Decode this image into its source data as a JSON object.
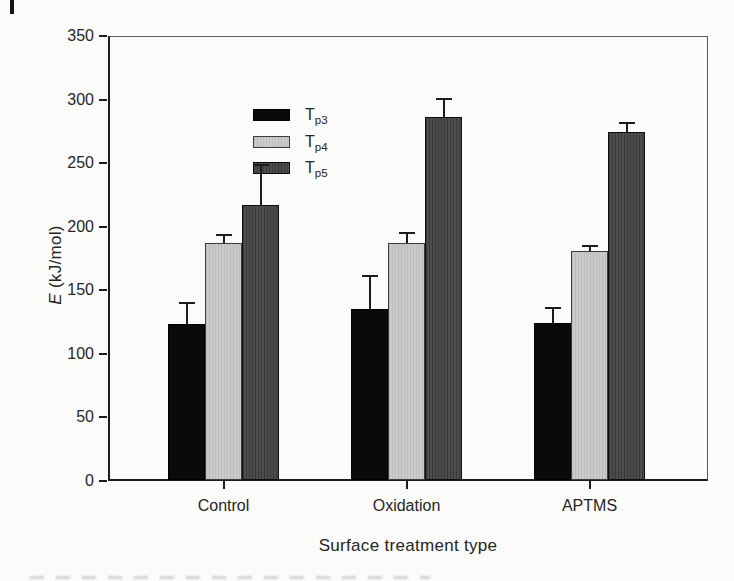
{
  "figure": {
    "kind": "scanned-book-bar-chart"
  },
  "chart_data": {
    "type": "bar",
    "title": "",
    "xlabel": "Surface treatment type",
    "ylabel_var": "E",
    "ylabel_unit": " (kJ/mol)",
    "ylim": [
      0,
      350
    ],
    "yticks": [
      0,
      50,
      100,
      150,
      200,
      250,
      300,
      350
    ],
    "grid": false,
    "legend_position": "upper-left",
    "categories": [
      "Control",
      "Oxidation",
      "APTMS"
    ],
    "series": [
      {
        "name_main": "T",
        "name_sub": "p3",
        "color": "#0a0a0a",
        "pattern": "solid",
        "values": [
          124,
          136,
          125
        ],
        "errors_plus": [
          17,
          26,
          12
        ]
      },
      {
        "name_main": "T",
        "name_sub": "p4",
        "color": "#c5c5c5",
        "pattern": "fine-vertical-light",
        "values": [
          188,
          188,
          182
        ],
        "errors_plus": [
          6,
          8,
          4
        ]
      },
      {
        "name_main": "T",
        "name_sub": "p5",
        "color": "#474747",
        "pattern": "fine-vertical-dark",
        "values": [
          218,
          287,
          275
        ],
        "errors_plus": [
          31,
          14,
          7
        ]
      }
    ]
  },
  "colors": {
    "background": "#fbfbfa",
    "axis": "#1c1c1c",
    "frame": "#5a5a5a",
    "text": "#242424"
  }
}
